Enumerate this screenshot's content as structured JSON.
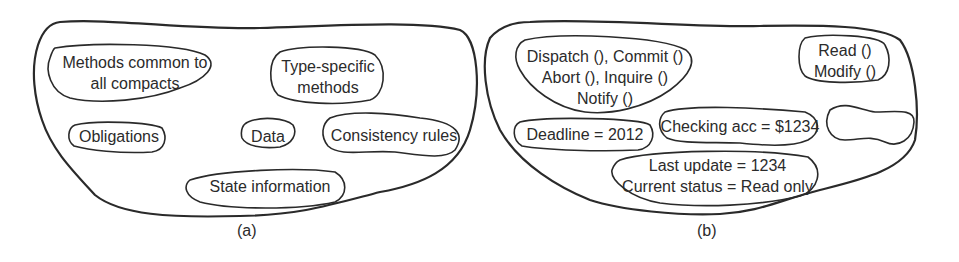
{
  "panel_a": {
    "caption": "(a)",
    "items": {
      "methods_common_1": "Methods common to",
      "methods_common_2": "all compacts",
      "type_specific_1": "Type-specific",
      "type_specific_2": "methods",
      "obligations": "Obligations",
      "data": "Data",
      "consistency_rules": "Consistency rules",
      "state_information": "State information"
    }
  },
  "panel_b": {
    "caption": "(b)",
    "items": {
      "methods_1": "Dispatch (), Commit ()",
      "methods_2": "Abort (), Inquire ()",
      "methods_3": "Notify ()",
      "read": "Read ()",
      "modify": "Modify ()",
      "deadline": "Deadline = 2012",
      "checking_acc": "Checking acc = $1234",
      "last_update": "Last update = 1234",
      "current_status": "Current status = Read only",
      "empty_blob": ""
    }
  },
  "colors": {
    "stroke": "#2a2a2a",
    "text": "#2b2b2b",
    "background": "#ffffff"
  }
}
